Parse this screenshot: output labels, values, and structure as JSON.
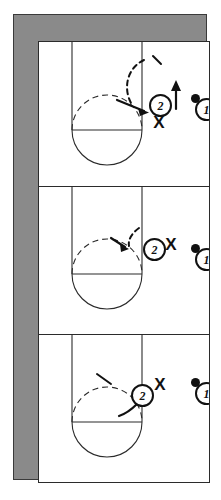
{
  "diagram": {
    "type": "basketball-play-sequence",
    "frame_color": "#8a8a8a",
    "line_color": "#2b2b2b",
    "court_background": "#ffffff",
    "panel_count": 3,
    "orientation": "vertical-stack"
  },
  "court": {
    "name": "half-court-key",
    "lane_label": "",
    "elements": [
      "lane-rectangle",
      "free-throw-line",
      "free-throw-circle-solid",
      "free-throw-circle-dashed",
      "baseline"
    ]
  },
  "panels": [
    {
      "index": 1,
      "name": "panel-one",
      "caption": "",
      "tokens": [
        {
          "id": "offense-2",
          "label": "2",
          "kind": "circled-number",
          "has_ball": false
        },
        {
          "id": "defender-x",
          "label": "X",
          "kind": "x-marker"
        },
        {
          "id": "offense-1",
          "label": "1",
          "kind": "circled-number",
          "has_ball": true
        }
      ],
      "movement": [
        {
          "name": "cut-arrow",
          "style": "dashed-curve",
          "desc": "2 curls off dashed path toward elbow"
        },
        {
          "name": "up-arrow",
          "style": "solid-straight",
          "desc": "pop upward"
        }
      ]
    },
    {
      "index": 2,
      "name": "panel-two",
      "caption": "",
      "tokens": [
        {
          "id": "offense-2",
          "label": "2",
          "kind": "circled-number",
          "has_ball": false
        },
        {
          "id": "defender-x",
          "label": "X",
          "kind": "x-marker"
        },
        {
          "id": "offense-1",
          "label": "1",
          "kind": "circled-number",
          "has_ball": true
        }
      ],
      "movement": [
        {
          "name": "cut-arrow",
          "style": "dashed-curve",
          "desc": "2 flares to the elbow"
        }
      ]
    },
    {
      "index": 3,
      "name": "panel-three",
      "caption": "",
      "tokens": [
        {
          "id": "offense-2",
          "label": "2",
          "kind": "circled-number",
          "has_ball": false
        },
        {
          "id": "defender-x",
          "label": "X",
          "kind": "x-marker"
        },
        {
          "id": "offense-1",
          "label": "1",
          "kind": "circled-number",
          "has_ball": true
        }
      ],
      "movement": [
        {
          "name": "cut-arrow",
          "style": "solid-curve",
          "desc": "2 drops toward the block"
        }
      ]
    }
  ],
  "legend": {
    "circled_number": "offensive player",
    "x_marker": "defensive player",
    "filled_dot": "ball"
  }
}
